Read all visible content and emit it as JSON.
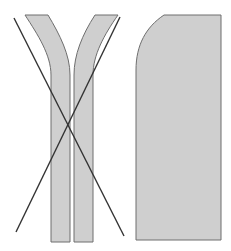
{
  "diagram": {
    "width": 231,
    "height": 251,
    "colors": {
      "background": "#ffffff",
      "fill": "#cfcfcf",
      "stroke": "#6e6e6e",
      "line": "#333333"
    },
    "shapes": [
      {
        "id": "left-strip",
        "type": "curved-strip"
      },
      {
        "id": "right-strip",
        "type": "curved-strip"
      },
      {
        "id": "panel",
        "type": "rounded-rect-top-left"
      },
      {
        "id": "cross-line-1",
        "type": "line"
      },
      {
        "id": "cross-line-2",
        "type": "line"
      }
    ]
  }
}
